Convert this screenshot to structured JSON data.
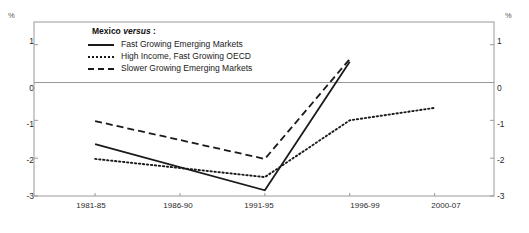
{
  "axis": {
    "unit_left": "%",
    "unit_right": "%",
    "y_ticks": [
      "1",
      "0",
      "-1",
      "-2",
      "-3"
    ],
    "x_ticks": [
      "1981-85",
      "1986-90",
      "1991-95",
      "1996-99",
      "2000-07"
    ]
  },
  "legend": {
    "title_main": "Mexico",
    "title_em": "versus",
    "title_colon": ":",
    "items": [
      {
        "label": "Fast Growing Emerging Markets",
        "style": "solid"
      },
      {
        "label": "High Income, Fast Growing OECD",
        "style": "dotted"
      },
      {
        "label": "Slower Growing Emerging Markets",
        "style": "dashed"
      }
    ]
  },
  "colors": {
    "line": "#1a1a1a",
    "zero_line": "#999999",
    "frame": "#9a9a9a",
    "text": "#1a1a1a"
  },
  "chart_data": {
    "type": "line",
    "title": "",
    "subtitle": "",
    "xlabel": "",
    "ylabel": "%",
    "categories": [
      "1981-85",
      "1986-90",
      "1991-95",
      "1996-99",
      "2000-07"
    ],
    "ylim": [
      -3,
      1.6
    ],
    "y_ticks": [
      1,
      0,
      -1,
      -2,
      -3
    ],
    "grid": false,
    "zero_line": true,
    "legend_position": "inside-top-left",
    "series": [
      {
        "name": "Fast Growing Emerging Markets",
        "style": "solid",
        "x": [
          "1981-85",
          "1991-95",
          "1996-99"
        ],
        "values": [
          -1.63,
          -2.85,
          0.55
        ]
      },
      {
        "name": "High Income, Fast Growing OECD",
        "style": "dotted",
        "x": [
          "1981-85",
          "1991-95",
          "1996-99",
          "2000-07"
        ],
        "values": [
          -2.02,
          -2.5,
          -1.0,
          -0.67
        ]
      },
      {
        "name": "Slower Growing Emerging Markets",
        "style": "dashed",
        "x": [
          "1981-85",
          "1991-95",
          "1996-99"
        ],
        "values": [
          -1.02,
          -2.02,
          0.62
        ]
      }
    ]
  }
}
